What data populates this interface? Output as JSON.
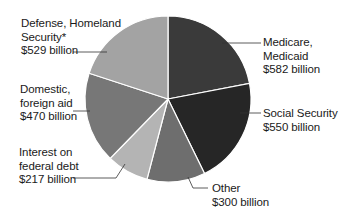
{
  "chart_data": {
    "type": "pie",
    "title": "",
    "unit": "billion USD",
    "start_angle_deg": 0,
    "direction": "clockwise",
    "slices": [
      {
        "name": "Medicare, Medicaid",
        "value": 582,
        "color": "#3a3a3a"
      },
      {
        "name": "Social Security",
        "value": 550,
        "color": "#262626"
      },
      {
        "name": "Other",
        "value": 300,
        "color": "#6e6e6e"
      },
      {
        "name": "Interest on federal debt",
        "value": 217,
        "color": "#b4b4b4"
      },
      {
        "name": "Domestic, foreign aid",
        "value": 470,
        "color": "#777777"
      },
      {
        "name": "Defense, Homeland Security*",
        "value": 529,
        "color": "#a3a3a3"
      }
    ],
    "legend": "none (callout labels)"
  },
  "labels": {
    "defense": {
      "line1": "Defense, Homeland",
      "line2": "Security*",
      "line3": "$529 billion"
    },
    "domestic": {
      "line1": "Domestic,",
      "line2": "foreign aid",
      "line3": "$470 billion"
    },
    "interest": {
      "line1": "Interest on",
      "line2": "federal debt",
      "line3": "$217 billion"
    },
    "medicare": {
      "line1": "Medicare,",
      "line2": "Medicaid",
      "line3": "$582 billion"
    },
    "social": {
      "line1": "Social Security",
      "line2": "$550 billion"
    },
    "other": {
      "line1": "Other",
      "line2": "$300 billion"
    }
  }
}
